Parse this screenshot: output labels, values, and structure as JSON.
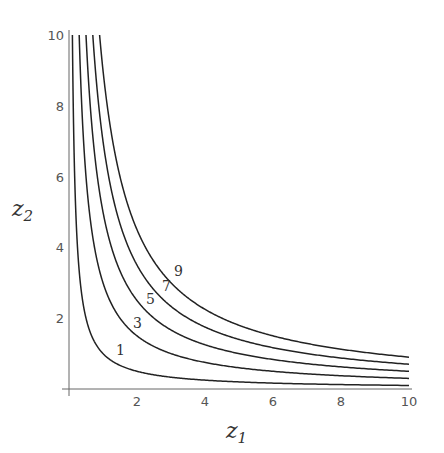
{
  "chart_data": {
    "type": "line",
    "title": "",
    "xlabel": "z1",
    "ylabel": "z2",
    "xlim": [
      0,
      10
    ],
    "ylim": [
      0,
      10
    ],
    "grid": false,
    "x_ticks": [
      "2",
      "4",
      "6",
      "8",
      "10"
    ],
    "y_ticks": [
      "2",
      "4",
      "6",
      "8",
      "10"
    ],
    "series": [
      {
        "name": "1",
        "equation": "z1*z2 = 1"
      },
      {
        "name": "3",
        "equation": "z1*z2 = 3"
      },
      {
        "name": "5",
        "equation": "z1*z2 = 5"
      },
      {
        "name": "7",
        "equation": "z1*z2 = 7"
      },
      {
        "name": "9",
        "equation": "z1*z2 = 9"
      }
    ],
    "levels": [
      1,
      3,
      5,
      7,
      9
    ],
    "curve_labels": [
      "1",
      "3",
      "5",
      "7",
      "9"
    ]
  },
  "axes": {
    "x_name": "z",
    "x_sub": "1",
    "y_name": "z",
    "y_sub": "2"
  }
}
